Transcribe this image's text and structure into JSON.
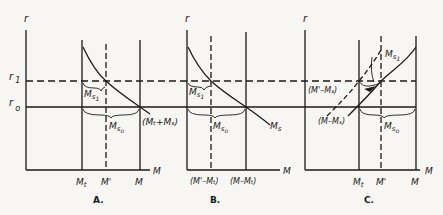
{
  "figure": {
    "axis_y_label": "r",
    "axis_x_label": "M",
    "interest_levels": {
      "r1": "r",
      "r1_sub": "1",
      "r0": "r",
      "r0_sub": "o"
    }
  },
  "panels": [
    {
      "caption": "A.",
      "x_ticks": [
        {
          "main": "M",
          "sub": "t"
        },
        {
          "main": "M'",
          "sub": ""
        },
        {
          "main": "M",
          "sub": ""
        }
      ],
      "labels": {
        "ms1": {
          "main": "M",
          "sub": "s",
          "subsub": "1"
        },
        "ms0": {
          "main": "M",
          "sub": "s",
          "subsub": "o"
        },
        "curve": "(Mₜ+Mₛ)"
      }
    },
    {
      "caption": "B.",
      "x_ticks": [
        {
          "text": "(M'–Mₜ)"
        },
        {
          "text": "(M–Mₜ)"
        }
      ],
      "labels": {
        "ms1": {
          "main": "M",
          "sub": "s",
          "subsub": "1"
        },
        "ms0": {
          "main": "M",
          "sub": "s",
          "subsub": "o"
        },
        "curve": {
          "main": "M",
          "sub": "s"
        }
      }
    },
    {
      "caption": "C.",
      "x_ticks": [
        {
          "main": "M",
          "sub": "t"
        },
        {
          "main": "M'",
          "sub": ""
        },
        {
          "main": "M",
          "sub": ""
        }
      ],
      "labels": {
        "ms1": {
          "main": "M",
          "sub": "s",
          "subsub": "1"
        },
        "ms0": {
          "main": "M",
          "sub": "s",
          "subsub": "o"
        },
        "curve_dashed": "(M'–Mₛ)",
        "curve_solid": "(M–Mₛ)"
      }
    }
  ]
}
